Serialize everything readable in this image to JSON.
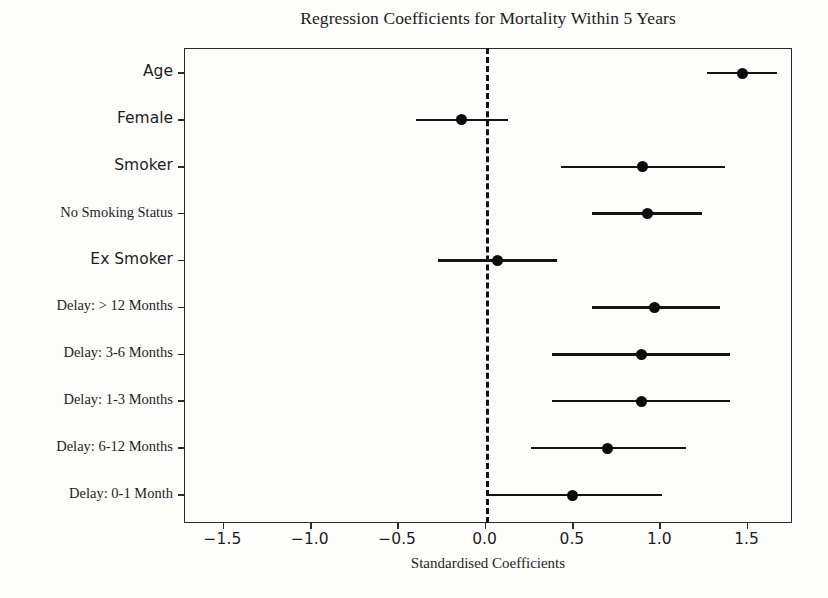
{
  "chart_data": {
    "type": "scatter",
    "title": "Regression Coefficients for Mortality Within 5 Years",
    "xlabel": "Standardised Coefficients",
    "ylabel": "",
    "xlim": [
      -1.72,
      1.76
    ],
    "xticks": [
      -1.5,
      -1.0,
      -0.5,
      0.0,
      0.5,
      1.0,
      1.5
    ],
    "xticklabels": [
      "−1.5",
      "−1.0",
      "−0.5",
      "0.0",
      "0.5",
      "1.0",
      "1.5"
    ],
    "grid": false,
    "legend": null,
    "reference_line": {
      "x": 0.0,
      "style": "dashed",
      "color": "#111111"
    },
    "categories": [
      "Age",
      "Female",
      "Smoker",
      "No Smoking Status",
      "Ex Smoker",
      "Delay: > 12 Months",
      "Delay: 3-6 Months",
      "Delay: 1-3 Months",
      "Delay: 6-12 Months",
      "Delay: 0-1 Month"
    ],
    "points": [
      {
        "label": "Age",
        "coef": 1.47,
        "ci_low": 1.27,
        "ci_high": 1.67,
        "font": "sans"
      },
      {
        "label": "Female",
        "coef": -0.14,
        "ci_low": -0.4,
        "ci_high": 0.13,
        "font": "sans"
      },
      {
        "label": "Smoker",
        "coef": 0.9,
        "ci_low": 0.43,
        "ci_high": 1.37,
        "font": "sans"
      },
      {
        "label": "No Smoking Status",
        "coef": 0.93,
        "ci_low": 0.61,
        "ci_high": 1.24,
        "font": "serif"
      },
      {
        "label": "Ex Smoker",
        "coef": 0.07,
        "ci_low": -0.27,
        "ci_high": 0.41,
        "font": "sans"
      },
      {
        "label": "Delay: > 12 Months",
        "coef": 0.97,
        "ci_low": 0.61,
        "ci_high": 1.34,
        "font": "serif"
      },
      {
        "label": "Delay: 3-6 Months",
        "coef": 0.89,
        "ci_low": 0.38,
        "ci_high": 1.4,
        "font": "serif"
      },
      {
        "label": "Delay: 1-3 Months",
        "coef": 0.89,
        "ci_low": 0.38,
        "ci_high": 1.4,
        "font": "serif"
      },
      {
        "label": "Delay: 6-12 Months",
        "coef": 0.7,
        "ci_low": 0.26,
        "ci_high": 1.15,
        "font": "serif"
      },
      {
        "label": "Delay: 0-1 Month",
        "coef": 0.5,
        "ci_low": 0.0,
        "ci_high": 1.01,
        "font": "serif"
      }
    ]
  },
  "colors": {
    "marker": "#0b0b0b",
    "line": "#141414",
    "axis": "#2a2a2a",
    "reference": "#111111",
    "background": "#fdfdfc",
    "text": "#1d1d1d"
  }
}
